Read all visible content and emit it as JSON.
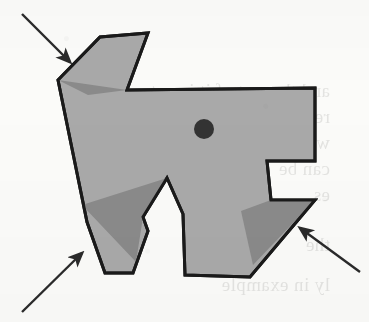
{
  "figure": {
    "caption": "",
    "background_color": "#fbfbf9",
    "polygon": {
      "name": "dog-shaped simple polygon",
      "fill_color": "#a9a9a9",
      "stroke_color": "#1a1a1a",
      "stroke_width": 3,
      "vertices": [
        [
          58,
          80
        ],
        [
          100,
          37
        ],
        [
          148,
          33
        ],
        [
          127,
          90
        ],
        [
          315,
          88
        ],
        [
          315,
          161
        ],
        [
          267,
          161
        ],
        [
          271,
          200
        ],
        [
          315,
          200
        ],
        [
          250,
          277
        ],
        [
          185,
          275
        ],
        [
          183,
          214
        ],
        [
          167,
          178
        ],
        [
          143,
          217
        ],
        [
          148,
          231
        ],
        [
          133,
          273
        ],
        [
          105,
          273
        ],
        [
          87,
          222
        ]
      ]
    },
    "shadow_wedges": {
      "name": "dark gray occluded regions",
      "fill_color": "#8a8a8a",
      "regions": [
        {
          "name": "upper-left-wedge",
          "points": [
            [
              58,
              80
            ],
            [
              127,
              90
            ],
            [
              88,
              95
            ]
          ]
        },
        {
          "name": "lower-left-wedge",
          "points": [
            [
              167,
              178
            ],
            [
              143,
              217
            ],
            [
              136,
              262
            ],
            [
              82,
              205
            ]
          ]
        },
        {
          "name": "right-wedge",
          "points": [
            [
              271,
              200
            ],
            [
              315,
              200
            ],
            [
              253,
              265
            ],
            [
              241,
              211
            ]
          ]
        }
      ]
    },
    "viewpoint_dot": {
      "name": "viewpoint",
      "center": [
        204,
        129
      ],
      "radius": 10,
      "color": "#333333"
    },
    "arrows": {
      "color": "#2a2a2a",
      "items": [
        {
          "name": "arrow-top-left",
          "from": [
            22,
            14
          ],
          "to": [
            70,
            62
          ],
          "label": ""
        },
        {
          "name": "arrow-bottom-left",
          "from": [
            22,
            312
          ],
          "to": [
            82,
            253
          ],
          "label": ""
        },
        {
          "name": "arrow-bottom-right",
          "from": [
            360,
            272
          ],
          "to": [
            300,
            228
          ],
          "label": ""
        }
      ]
    },
    "bleed_through_text": {
      "note": "faint mirrored show-through from the reverse page",
      "lines": [
        "and the rest of it is not",
        "region is computed",
        "we use the r",
        "can be",
        "es",
        "the",
        "ly in  example"
      ]
    }
  }
}
